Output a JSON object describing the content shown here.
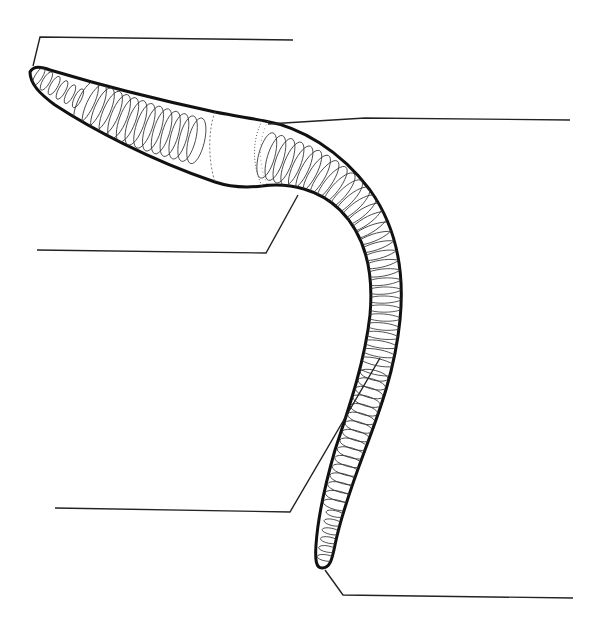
{
  "diagram": {
    "labels": [
      {
        "id": "anterior-end",
        "text": ""
      },
      {
        "id": "clitellum",
        "text": ""
      },
      {
        "id": "setae",
        "text": ""
      },
      {
        "id": "segments",
        "text": ""
      },
      {
        "id": "posterior-end",
        "text": ""
      }
    ]
  }
}
